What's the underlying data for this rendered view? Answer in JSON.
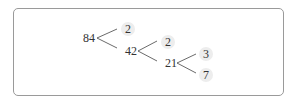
{
  "diagram": {
    "type": "factor-tree",
    "root": "84",
    "nodes": [
      {
        "id": "n84",
        "label": "84",
        "x": 88,
        "y": 36,
        "prime": false
      },
      {
        "id": "n2a",
        "label": "2",
        "x": 128,
        "y": 28,
        "prime": true
      },
      {
        "id": "n42",
        "label": "42",
        "x": 128,
        "y": 51,
        "prime": false
      },
      {
        "id": "n2b",
        "label": "2",
        "x": 168,
        "y": 41,
        "prime": true
      },
      {
        "id": "n21",
        "label": "21",
        "x": 168,
        "y": 63,
        "prime": false
      },
      {
        "id": "n3",
        "label": "3",
        "x": 206,
        "y": 53,
        "prime": true
      },
      {
        "id": "n7",
        "label": "7",
        "x": 206,
        "y": 74,
        "prime": true
      }
    ],
    "edges": [
      {
        "from": "n84",
        "to": "n2a"
      },
      {
        "from": "n84",
        "to": "n42"
      },
      {
        "from": "n42",
        "to": "n2b"
      },
      {
        "from": "n42",
        "to": "n21"
      },
      {
        "from": "n21",
        "to": "n3"
      },
      {
        "from": "n21",
        "to": "n7"
      }
    ],
    "prime_factors": [
      "2",
      "2",
      "3",
      "7"
    ]
  }
}
